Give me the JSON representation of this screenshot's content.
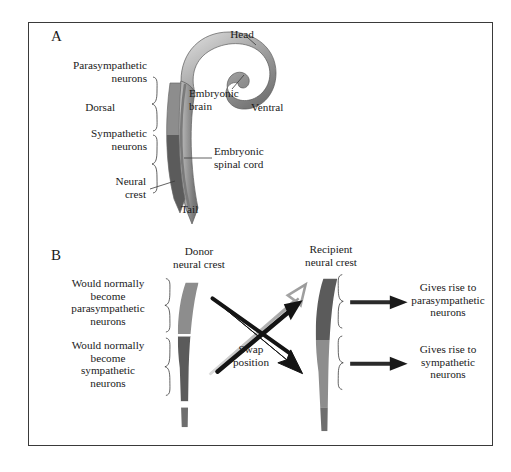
{
  "figure": {
    "background": "#ffffff",
    "border_color": "#3a3a3a",
    "colors": {
      "parasympathetic_segment": "#8d8d8d",
      "sympathetic_segment": "#5b5b5b",
      "embryo_body": "#9a9a9a",
      "embryo_body_dark": "#6e6e6e",
      "arrow_dark": "#1a1a1a",
      "arrow_light": "#b3b3b3",
      "text": "#1a1a1a"
    }
  },
  "panelA": {
    "letter": "A",
    "labels": {
      "head": "Head",
      "parasympathetic_neurons": "Parasympathetic\nneurons",
      "dorsal": "Dorsal",
      "ventral": "Ventral",
      "sympathetic_neurons": "Sympathetic\nneurons",
      "embryonic_brain": "Embryonic\nbrain",
      "embryonic_spinal_cord": "Embryonic\nspinal cord",
      "neural_crest": "Neural\ncrest",
      "tail": "Tail"
    }
  },
  "panelB": {
    "letter": "B",
    "labels": {
      "donor_title": "Donor\nneural crest",
      "recipient_title": "Recipient\nneural crest",
      "would_become_parasympathetic": "Would normally\nbecome\nparasympathetic\nneurons",
      "would_become_sympathetic": "Would normally\nbecome\nsympathetic\nneurons",
      "swap_position": "Swap\nposition",
      "gives_rise_parasympathetic": "Gives rise to\nparasympathetic\nneurons",
      "gives_rise_sympathetic": "Gives rise to\nsympathetic\nneurons"
    },
    "donor_segments": [
      {
        "region": "upper",
        "fill": "#8d8d8d",
        "fate": "parasympathetic"
      },
      {
        "region": "lower",
        "fill": "#5b5b5b",
        "fate": "sympathetic"
      }
    ],
    "recipient_segments": [
      {
        "region": "upper",
        "fill": "#5b5b5b",
        "fate": "parasympathetic"
      },
      {
        "region": "lower",
        "fill": "#8d8d8d",
        "fate": "sympathetic"
      }
    ]
  }
}
